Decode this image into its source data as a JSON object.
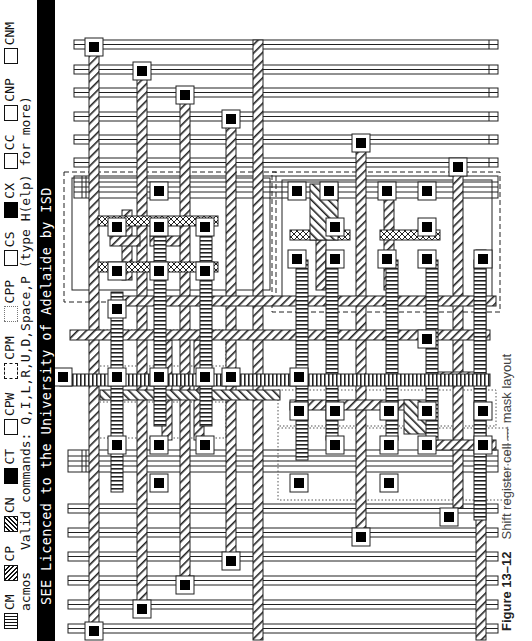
{
  "header": {
    "legend": [
      {
        "code": "CM",
        "swatch": "vertical-stripes"
      },
      {
        "code": "CP",
        "swatch": "hatch-right"
      },
      {
        "code": "CN",
        "swatch": "hatch-left"
      },
      {
        "code": "CT",
        "swatch": "solid-black"
      },
      {
        "code": "CPW",
        "swatch": "dashed-box"
      },
      {
        "code": "CPM",
        "swatch": "dotted-box"
      },
      {
        "code": "CPP",
        "swatch": "open-box"
      },
      {
        "code": "CS",
        "swatch": "open-box"
      },
      {
        "code": "CX",
        "swatch": "solid-black"
      },
      {
        "code": "CC",
        "swatch": "open-box"
      },
      {
        "code": "CNP",
        "swatch": "open-box"
      },
      {
        "code": "CNM",
        "swatch": "open-box"
      }
    ],
    "program": "acmos",
    "commands": "Valid commands: Q,I,L,R,U,D,Space,P (type H(elp) for more)",
    "licence": "SEE Licenced to the University of Adelaide by ISD"
  },
  "caption": {
    "figure": "Figure 13–12",
    "text": "Shift register cell — mask layout"
  },
  "colors": {
    "ink": "#111111",
    "background": "#ffffff",
    "bar": "#000000"
  }
}
